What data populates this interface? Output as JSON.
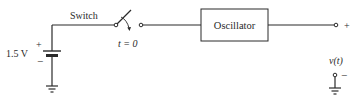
{
  "diagram": {
    "type": "circuit",
    "components": {
      "battery": {
        "label": "1.5 V",
        "plus": "+",
        "minus": "−"
      },
      "switch": {
        "label": "Switch",
        "time_label": "t = 0"
      },
      "oscillator": {
        "label": "Oscillator"
      },
      "output": {
        "plus": "+",
        "minus": "−",
        "label": "v(t)"
      }
    },
    "colors": {
      "line": "#2a2a2a",
      "background": "#ffffff"
    }
  }
}
